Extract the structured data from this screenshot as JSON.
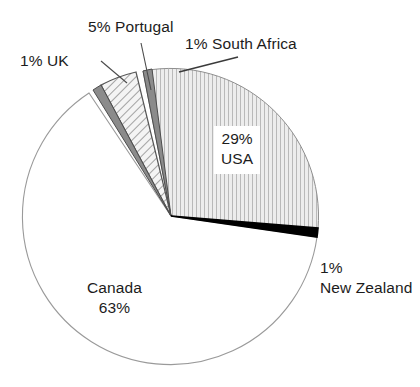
{
  "chart_data": {
    "type": "pie",
    "title": "",
    "subtitle": "",
    "xlabel": "",
    "ylabel": "",
    "legend_position": "none",
    "grid": false,
    "units": "percent",
    "total": 100,
    "categories": [
      "Canada",
      "USA",
      "Portugal",
      "UK",
      "South Africa",
      "New Zealand"
    ],
    "values": [
      63,
      29,
      5,
      1,
      1,
      1
    ],
    "slices": [
      {
        "label": "Canada",
        "value": 63,
        "value_text": "63%",
        "label_text": "Canada",
        "fill": "white",
        "fill_hex": "#ffffff",
        "stroke_hex": "#8c8c8c",
        "start_angle": 123.6,
        "end_angle": 350.4
      },
      {
        "label": "USA",
        "value": 29,
        "value_text": "29%",
        "label_text": "USA",
        "fill": "vertical-lines",
        "fill_hex": "#ebebeb",
        "stroke_hex": "#6e6e6e",
        "start_angle": 356.4,
        "end_angle": 100.8
      },
      {
        "label": "Portugal",
        "value": 5,
        "value_text": "5%",
        "label_text": "Portugal",
        "fill": "diagonal-hatch",
        "fill_hex": "#f2f2f2",
        "stroke_hex": "#5a5a5a",
        "start_angle": 104.4,
        "end_angle": 122.4
      },
      {
        "label": "UK",
        "value": 1,
        "value_text": "1%",
        "label_text": "UK",
        "fill": "solid-gray",
        "fill_hex": "#8a8a8a",
        "stroke_hex": "#4a4a4a",
        "start_angle": 122.4,
        "end_angle": 126.0
      },
      {
        "label": "South Africa",
        "value": 1,
        "value_text": "1%",
        "label_text": "South Africa",
        "fill": "solid-gray",
        "fill_hex": "#8a8a8a",
        "stroke_hex": "#4a4a4a",
        "start_angle": 100.8,
        "end_angle": 104.4
      },
      {
        "label": "New Zealand",
        "value": 1,
        "value_text": "1%",
        "label_text": "New Zealand",
        "fill": "solid-black",
        "fill_hex": "#000000",
        "stroke_hex": "#000000",
        "start_angle": 352.8,
        "end_angle": 356.4
      }
    ],
    "annotations": [
      {
        "name": "uk",
        "line1": "1% UK",
        "line2": ""
      },
      {
        "name": "portugal",
        "line1": "5% Portugal",
        "line2": ""
      },
      {
        "name": "south_africa",
        "line1": "1% South Africa",
        "line2": ""
      },
      {
        "name": "usa",
        "line1": "29%",
        "line2": "USA"
      },
      {
        "name": "canada",
        "line1": "Canada",
        "line2": "63%"
      },
      {
        "name": "new_zealand",
        "line1": "1%",
        "line2": "New Zealand"
      }
    ]
  },
  "labels": {
    "uk": {
      "line1": "1% UK",
      "line2": ""
    },
    "portugal": {
      "line1": "5% Portugal",
      "line2": ""
    },
    "south_africa": {
      "line1": "1% South Africa",
      "line2": ""
    },
    "usa": {
      "line1": "29%",
      "line2": "USA"
    },
    "canada": {
      "line1": "Canada",
      "line2": "63%"
    },
    "new_zealand": {
      "line1": "1%",
      "line2": "New Zealand"
    }
  }
}
